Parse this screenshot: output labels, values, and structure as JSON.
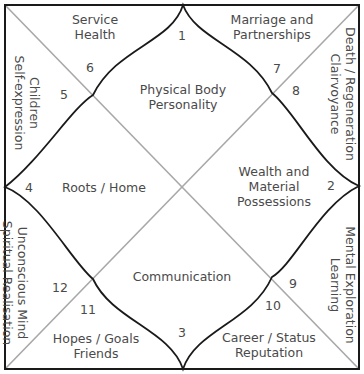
{
  "colors": {
    "border": "#1a1a1a",
    "curve": "#1a1a1a",
    "diagonal": "#a8a8a8",
    "text": "#4a4a4a"
  },
  "houses": [
    {
      "number": "1",
      "line1": "Physical Body",
      "line2": "Personality"
    },
    {
      "number": "2",
      "line1": "Wealth and",
      "line2": "Material",
      "line3": "Possessions"
    },
    {
      "number": "3",
      "line1": "Communication"
    },
    {
      "number": "4",
      "line1": "Roots / Home"
    },
    {
      "number": "5",
      "line1": "Children",
      "line2": "Self-expression"
    },
    {
      "number": "6",
      "line1": "Service",
      "line2": "Health"
    },
    {
      "number": "7",
      "line1": "Marriage and",
      "line2": "Partnerships"
    },
    {
      "number": "8",
      "line1": "Death / Regeneration",
      "line2": "Clairvoyance"
    },
    {
      "number": "9",
      "line1": "Mental Exploration",
      "line2": "Learning"
    },
    {
      "number": "10",
      "line1": "Career / Status",
      "line2": "Reputation"
    },
    {
      "number": "11",
      "line1": "Hopes / Goals",
      "line2": "Friends"
    },
    {
      "number": "12",
      "line1": "Unconscious Mind",
      "line2": "Spiritual Realisation"
    }
  ]
}
